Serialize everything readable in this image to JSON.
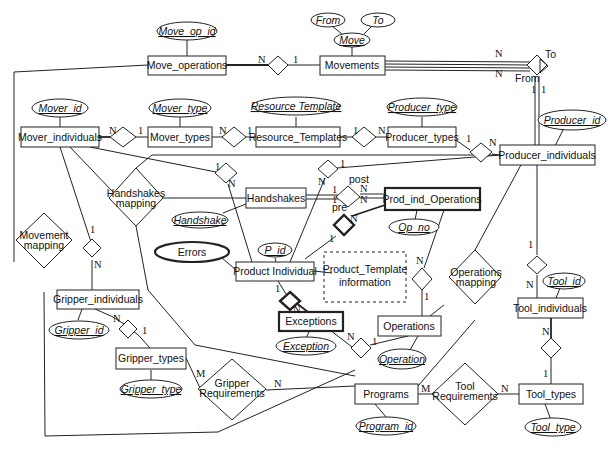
{
  "diagram": {
    "type": "entity-relationship",
    "entities": {
      "move_operations": "Move_operations",
      "movements": "Movements",
      "mover_individuals": "Mover_individuals",
      "mover_types": "Mover_types",
      "resource_templates": "Resource_Templates",
      "producer_types": "Producer_types",
      "producer_individuals": "Producer_individuals",
      "handshakes": "Handshakes",
      "prod_ind_operations": "Prod_ind_Operations",
      "product_individual": "Product Individual",
      "gripper_individuals": "Gripper_individuals",
      "gripper_types": "Gripper_types",
      "exceptions": "Exceptions",
      "operations": "Operations",
      "tool_individuals": "Tool_individuals",
      "programs": "Programs",
      "tool_types": "Tool_types"
    },
    "attributes": {
      "move_op_id": "Move_op_id",
      "from": "From",
      "to": "To",
      "move": "Move",
      "mover_id": "Mover_id",
      "mover_type": "Mover_type",
      "resource_template": "Resource Template",
      "producer_type": "Producer_type",
      "producer_id": "Producer_id",
      "handshake": "Handshake",
      "errors": "Errors",
      "p_id": "P_id",
      "op_no": "Op_no",
      "gripper_id": "Gripper_id",
      "gripper_type": "Gripper_type",
      "exception": "Exception",
      "operation": "Operation",
      "tool_id": "Tool_id",
      "program_id": "Program_id",
      "tool_type": "Tool_type"
    },
    "relationships": {
      "handshakes_mapping": [
        "Handshakes",
        "mapping"
      ],
      "movement_mapping": [
        "Movement",
        "mapping"
      ],
      "operations_mapping": [
        "Operations",
        "mapping"
      ],
      "gripper_requirements": [
        "Gripper",
        "Requirements"
      ],
      "tool_requirements": [
        "Tool",
        "Requirements"
      ]
    },
    "note": [
      "Product_Template",
      "information"
    ],
    "role_labels": {
      "to": "To",
      "from": "From",
      "post": "post",
      "pre": "pre"
    },
    "cardinalities": {
      "one": "1",
      "many": "N",
      "many_m": "M"
    }
  }
}
